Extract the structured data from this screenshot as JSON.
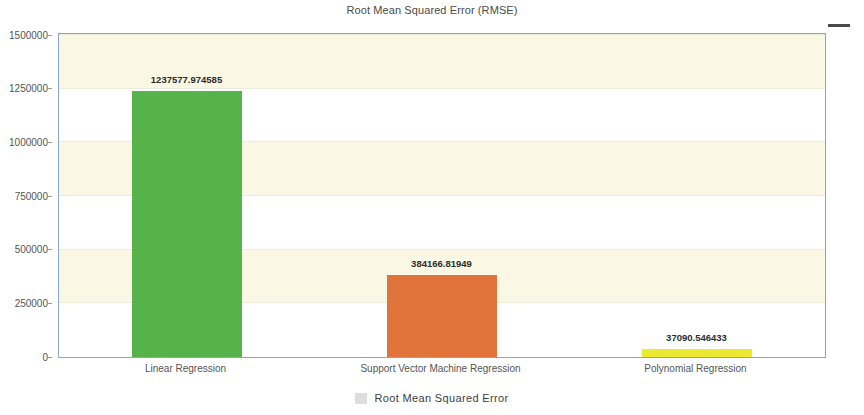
{
  "header": {
    "title": "Root Mean Squared Error (RMSE)",
    "menu_icon": "hamburger-menu-icon"
  },
  "legend": {
    "position": "bottom",
    "marker_color": "#dddddd",
    "items": [
      {
        "label": "Root Mean Squared Error"
      }
    ]
  },
  "chart_data": {
    "type": "bar",
    "title": "Root Mean Squared Error (RMSE)",
    "subtitle": "",
    "xlabel": "",
    "ylabel": "",
    "categories": [
      "Linear Regression",
      "Support Vector Machine Regression",
      "Polynomial Regression"
    ],
    "values": [
      1237577.974585,
      384166.81949,
      37090.546433
    ],
    "value_labels": [
      "1237577.974585",
      "384166.81949",
      "37090.546433"
    ],
    "bar_colors": [
      "#55b34a",
      "#e0743a",
      "#ece932"
    ],
    "series": [
      {
        "name": "Root Mean Squared Error",
        "values": [
          1237577.974585,
          384166.81949,
          37090.546433
        ]
      }
    ],
    "ylim": [
      0,
      1500000
    ],
    "ytick_labels": [
      "0",
      "250000",
      "500000",
      "750000",
      "1000000",
      "1250000",
      "1500000"
    ],
    "ytick_values": [
      0,
      250000,
      500000,
      750000,
      1000000,
      1250000,
      1500000
    ],
    "grid": true,
    "grid_banding": true,
    "band_colors": [
      "#faf7e4",
      "#ffffff"
    ],
    "plot_border_color": "#89a4d0",
    "legend_position": "bottom"
  }
}
